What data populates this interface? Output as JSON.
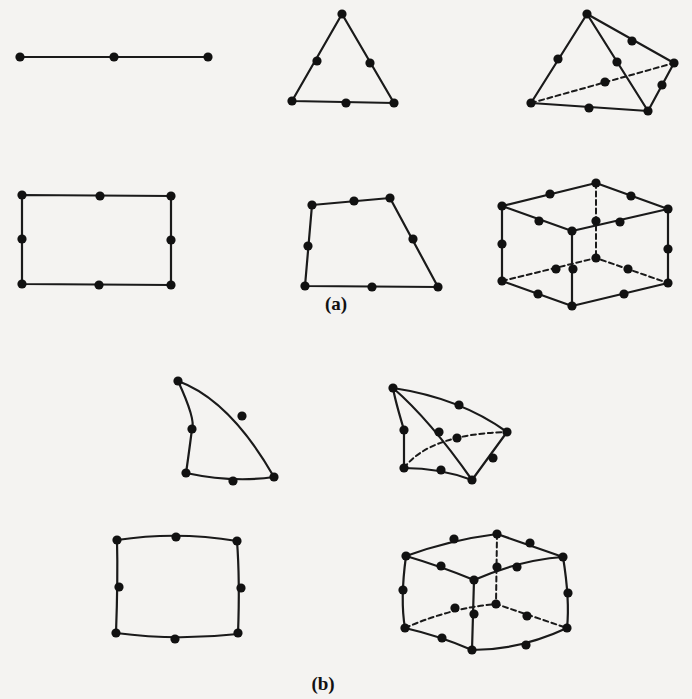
{
  "figure": {
    "background": "#f4f3f1",
    "ink": "#111111",
    "node_radius": 4.6,
    "panels": [
      {
        "id": "a",
        "label": "(a)",
        "label_pos": [
          336,
          310
        ],
        "description": "Quadratic (straight-sided) elements",
        "elements": [
          {
            "name": "line-3-node-element",
            "edges": [
              {
                "d": "M20 57 L208 57",
                "hidden": false
              }
            ],
            "nodes": [
              [
                20,
                57
              ],
              [
                114,
                57
              ],
              [
                208,
                57
              ]
            ]
          },
          {
            "name": "triangle-6-node-element",
            "edges": [
              {
                "d": "M342 14 L292 101 L394 103 Z",
                "hidden": false
              }
            ],
            "nodes": [
              [
                342,
                14
              ],
              [
                317,
                61
              ],
              [
                370,
                63
              ],
              [
                292,
                101
              ],
              [
                346,
                103
              ],
              [
                394,
                103
              ]
            ]
          },
          {
            "name": "tetrahedron-10-node-element",
            "edges": [
              {
                "d": "M587 14 L531 103",
                "hidden": false
              },
              {
                "d": "M587 14 L674 63",
                "hidden": false
              },
              {
                "d": "M587 14 L648 111",
                "hidden": false
              },
              {
                "d": "M531 103 L648 111",
                "hidden": false
              },
              {
                "d": "M648 111 L674 63",
                "hidden": false
              },
              {
                "d": "M531 103 L674 63",
                "hidden": true
              }
            ],
            "nodes": [
              [
                587,
                14
              ],
              [
                558,
                59
              ],
              [
                632,
                41
              ],
              [
                617,
                62
              ],
              [
                674,
                63
              ],
              [
                605,
                82
              ],
              [
                662,
                85
              ],
              [
                531,
                103
              ],
              [
                589,
                108
              ],
              [
                648,
                111
              ]
            ]
          },
          {
            "name": "rectangle-8-node-element",
            "edges": [
              {
                "d": "M22 195 L171 196 L171 285 L22 284 Z",
                "hidden": false
              }
            ],
            "nodes": [
              [
                22,
                195
              ],
              [
                100,
                196
              ],
              [
                171,
                196
              ],
              [
                22,
                239
              ],
              [
                171,
                240
              ],
              [
                22,
                284
              ],
              [
                99,
                285
              ],
              [
                171,
                285
              ]
            ]
          },
          {
            "name": "quadrilateral-8-node-element",
            "edges": [
              {
                "d": "M312 205 L390 198 L438 287 L305 286 Z",
                "hidden": false
              }
            ],
            "nodes": [
              [
                312,
                205
              ],
              [
                354,
                201
              ],
              [
                390,
                198
              ],
              [
                308,
                246
              ],
              [
                413,
                239
              ],
              [
                305,
                286
              ],
              [
                372,
                287
              ],
              [
                438,
                287
              ]
            ]
          },
          {
            "name": "hexahedron-20-node-element",
            "edges": [
              {
                "d": "M502 206 L596 183 L668 209 L572 231 Z",
                "hidden": false
              },
              {
                "d": "M502 206 L502 281",
                "hidden": false
              },
              {
                "d": "M572 231 L572 306",
                "hidden": false
              },
              {
                "d": "M668 209 L668 283",
                "hidden": false
              },
              {
                "d": "M502 281 L572 306 L668 283",
                "hidden": false
              },
              {
                "d": "M596 183 L596 258",
                "hidden": true
              },
              {
                "d": "M502 281 L596 258 L668 283",
                "hidden": true
              }
            ],
            "nodes": [
              [
                502,
                206
              ],
              [
                550,
                194
              ],
              [
                596,
                183
              ],
              [
                631,
                196
              ],
              [
                668,
                209
              ],
              [
                539,
                221
              ],
              [
                620,
                222
              ],
              [
                572,
                231
              ],
              [
                596,
                221
              ],
              [
                502,
                244
              ],
              [
                668,
                249
              ],
              [
                596,
                258
              ],
              [
                556,
                269
              ],
              [
                573,
                269
              ],
              [
                628,
                269
              ],
              [
                502,
                281
              ],
              [
                538,
                294
              ],
              [
                624,
                294
              ],
              [
                668,
                283
              ],
              [
                572,
                306
              ]
            ]
          }
        ]
      },
      {
        "id": "b",
        "label": "(b)",
        "label_pos": [
          323,
          690
        ],
        "description": "Curved (isoparametric) elements",
        "elements": [
          {
            "name": "curved-triangle-6-node-element",
            "edges": [
              {
                "d": "M178 381 Q230 400 274 477",
                "hidden": false
              },
              {
                "d": "M178 381 Q196 420 192 429 Q188 460 186 473",
                "hidden": false
              },
              {
                "d": "M186 473 Q233 483 274 477",
                "hidden": false
              }
            ],
            "nodes": [
              [
                178,
                381
              ],
              [
                242,
                416
              ],
              [
                192,
                429
              ],
              [
                186,
                473
              ],
              [
                233,
                481
              ],
              [
                274,
                477
              ]
            ]
          },
          {
            "name": "curved-tetrahedron-10-node-element",
            "edges": [
              {
                "d": "M393 388 Q460 398 507 432",
                "hidden": false
              },
              {
                "d": "M393 388 Q395 400 404 430 L404 468",
                "hidden": false
              },
              {
                "d": "M393 388 Q430 420 472 480",
                "hidden": false
              },
              {
                "d": "M404 468 Q440 468 472 480",
                "hidden": false
              },
              {
                "d": "M472 480 L507 432",
                "hidden": false
              },
              {
                "d": "M404 468 Q430 434 507 432",
                "hidden": true
              }
            ],
            "nodes": [
              [
                393,
                388
              ],
              [
                459,
                405
              ],
              [
                404,
                430
              ],
              [
                439,
                432
              ],
              [
                457,
                438
              ],
              [
                507,
                432
              ],
              [
                493,
                458
              ],
              [
                404,
                468
              ],
              [
                441,
                470
              ],
              [
                472,
                480
              ]
            ]
          },
          {
            "name": "curved-quadrilateral-8-node-element",
            "edges": [
              {
                "d": "M117 540 Q177 531 237 541 Q240 580 238 634 Q176 641 116 633 Q118 580 117 540 Z",
                "hidden": false
              }
            ],
            "nodes": [
              [
                117,
                540
              ],
              [
                176,
                537
              ],
              [
                237,
                541
              ],
              [
                119,
                587
              ],
              [
                241,
                588
              ],
              [
                116,
                633
              ],
              [
                175,
                639
              ],
              [
                238,
                633
              ]
            ]
          },
          {
            "name": "curved-hexahedron-20-node-element",
            "edges": [
              {
                "d": "M406 556 Q450 540 497 534 L563 557 Q520 560 474 580 Q440 566 406 556 Z",
                "hidden": false
              },
              {
                "d": "M406 556 Q400 600 405 628",
                "hidden": false
              },
              {
                "d": "M474 580 L472 650",
                "hidden": false
              },
              {
                "d": "M563 557 Q570 600 567 628",
                "hidden": false
              },
              {
                "d": "M405 628 Q440 636 472 650 Q520 650 567 628",
                "hidden": false
              },
              {
                "d": "M497 534 L496 604",
                "hidden": true
              },
              {
                "d": "M405 628 Q450 608 496 604 L567 628",
                "hidden": true
              }
            ],
            "nodes": [
              [
                406,
                556
              ],
              [
                454,
                539
              ],
              [
                497,
                534
              ],
              [
                530,
                543
              ],
              [
                563,
                557
              ],
              [
                441,
                566
              ],
              [
                517,
                567
              ],
              [
                474,
                580
              ],
              [
                497,
                567
              ],
              [
                403,
                590
              ],
              [
                568,
                593
              ],
              [
                496,
                604
              ],
              [
                455,
                608
              ],
              [
                474,
                614
              ],
              [
                527,
                616
              ],
              [
                405,
                628
              ],
              [
                442,
                638
              ],
              [
                526,
                645
              ],
              [
                567,
                628
              ],
              [
                472,
                650
              ]
            ]
          }
        ]
      }
    ]
  }
}
